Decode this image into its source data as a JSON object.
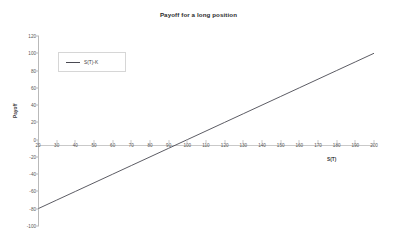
{
  "chart_data": {
    "type": "line",
    "title": "Payoff for a long position",
    "xlabel": "S(T)",
    "ylabel": "Payoff",
    "xlim": [
      20,
      200
    ],
    "ylim": [
      -100,
      120
    ],
    "xticks": [
      20,
      30,
      40,
      50,
      60,
      70,
      80,
      90,
      100,
      110,
      120,
      130,
      140,
      150,
      160,
      170,
      180,
      190,
      200
    ],
    "yticks": [
      120,
      100,
      80,
      60,
      40,
      20,
      0,
      -20,
      -40,
      -60,
      -80,
      -100
    ],
    "grid": false,
    "legend_position": "upper-left",
    "series": [
      {
        "name": "S(T)-K",
        "color": "#4a4a52",
        "x": [
          20,
          30,
          40,
          50,
          60,
          70,
          80,
          90,
          100,
          110,
          120,
          130,
          140,
          150,
          160,
          170,
          180,
          190,
          200
        ],
        "values": [
          -80,
          -70,
          -60,
          -50,
          -40,
          -30,
          -20,
          -10,
          0,
          10,
          20,
          30,
          40,
          50,
          60,
          70,
          80,
          90,
          100
        ]
      }
    ],
    "annotations": {
      "strike_K": 100,
      "zero_crossing_x": 100
    }
  },
  "legend": {
    "entries": [
      {
        "label": "S(T)-K"
      }
    ]
  }
}
